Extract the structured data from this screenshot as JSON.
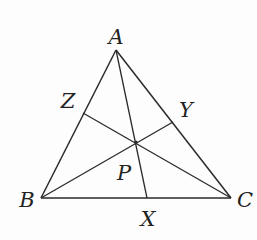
{
  "diagram": {
    "type": "triangle-with-concurrent-cevians",
    "stroke_color": "#2a2a2a",
    "label_color": "#222222",
    "points": {
      "A": {
        "label": "A",
        "x": 116,
        "y": 50,
        "label_x": 116,
        "label_y": 44
      },
      "B": {
        "label": "B",
        "x": 41,
        "y": 198,
        "label_x": 27,
        "label_y": 207
      },
      "C": {
        "label": "C",
        "x": 231,
        "y": 198,
        "label_x": 245,
        "label_y": 207
      },
      "X": {
        "label": "X",
        "x": 147,
        "y": 198,
        "label_x": 148,
        "label_y": 226
      },
      "Y": {
        "label": "Y",
        "x": 173,
        "y": 122,
        "label_x": 186,
        "label_y": 117
      },
      "Z": {
        "label": "Z",
        "x": 83,
        "y": 113,
        "label_x": 68,
        "label_y": 108
      },
      "P": {
        "label": "P",
        "x": 136,
        "y": 142,
        "label_x": 124,
        "label_y": 180
      }
    },
    "edges": [
      [
        "A",
        "B"
      ],
      [
        "B",
        "C"
      ],
      [
        "C",
        "A"
      ]
    ],
    "cevians": [
      [
        "A",
        "X"
      ],
      [
        "B",
        "Y"
      ],
      [
        "C",
        "Z"
      ]
    ]
  }
}
